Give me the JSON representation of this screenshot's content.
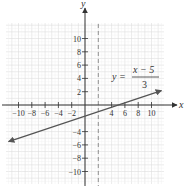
{
  "chart_data": {
    "type": "line",
    "title": "",
    "xlabel": "x",
    "ylabel": "y",
    "xlim": [
      -12,
      12
    ],
    "ylim": [
      -12,
      12
    ],
    "grid": true,
    "x_ticks": [
      -10,
      -8,
      -6,
      -4,
      -2,
      4,
      6,
      8,
      10
    ],
    "y_ticks": [
      10,
      8,
      6,
      4,
      2,
      -4,
      -6,
      -8,
      -10
    ],
    "x_tick_labels": [
      "−10",
      "−8",
      "−6",
      "−4",
      "−2",
      "4",
      "6",
      "8",
      "10"
    ],
    "y_tick_labels": [
      "10",
      "8",
      "6",
      "4",
      "2",
      "−4",
      "−6",
      "−8",
      "−10"
    ],
    "series": [
      {
        "name": "y = (x − 5)/3",
        "style": "solid line with arrowheads",
        "color": "#555555",
        "x": [
          -11.5,
          -5,
          0,
          5,
          11.5
        ],
        "y": [
          -5.5,
          -3.33,
          -1.67,
          0,
          2.17
        ]
      }
    ],
    "annotations": [
      {
        "type": "vertical-dashed-line",
        "x": 2,
        "color": "#777777"
      },
      {
        "type": "equation-label",
        "lhs": "y =",
        "numerator": "x − 5",
        "denominator": "3",
        "position": [
          6,
          3.5
        ]
      }
    ]
  },
  "labels": {
    "x_axis": "x",
    "y_axis": "y",
    "eq_lhs": "y =",
    "eq_num": "x − 5",
    "eq_den": "3"
  }
}
